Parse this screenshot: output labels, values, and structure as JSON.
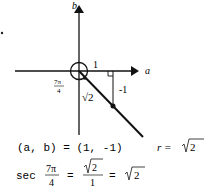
{
  "diagram": {
    "axis_labels": {
      "x": "a",
      "y": "b"
    },
    "labels": {
      "adjacent": "1",
      "opposite": "-1",
      "hypotenuse": "√2",
      "angle_num": "7π",
      "angle_den": "4"
    }
  },
  "equations": {
    "point": "(a, b) = (1, -1)",
    "r_lhs": "r = ",
    "r_rhs": "2",
    "sec_word": "sec",
    "sec_num": "7π",
    "sec_den": "4",
    "eq": "=",
    "frac_num": "2",
    "frac_den": "1",
    "eq2": "=",
    "result": "2"
  }
}
